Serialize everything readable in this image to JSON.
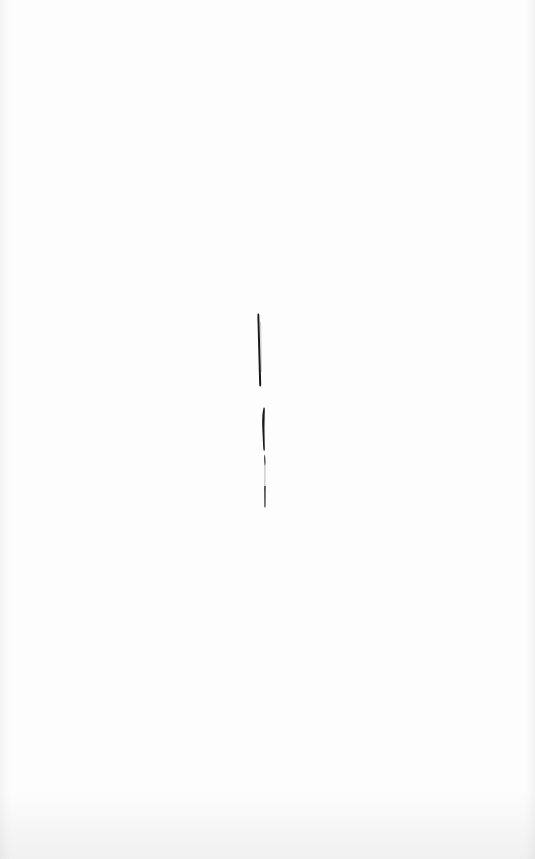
{
  "artwork": {
    "background_color": "#fdfdfd",
    "ink_color": "#1a1a1a",
    "strokes": [
      {
        "name": "upper-stroke",
        "x": 258,
        "y_top": 315,
        "y_bottom": 385
      },
      {
        "name": "lower-stroke",
        "x": 263,
        "y_top": 408,
        "y_bottom": 508
      }
    ]
  }
}
